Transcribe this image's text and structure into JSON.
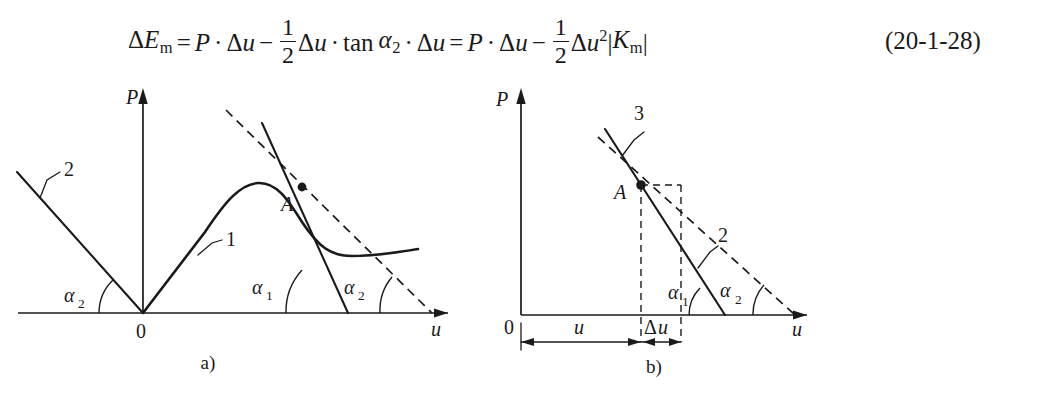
{
  "equation": {
    "number": "(20-1-28)",
    "lhs": {
      "delta": "Δ",
      "E": "E",
      "E_sub": "m"
    },
    "terms": {
      "equals": "=",
      "P": "P",
      "cdot": "·",
      "minus": "−",
      "delta": "Δ",
      "u": "u",
      "frac_num": "1",
      "frac_den": "2",
      "tan": "tan",
      "alpha": "α",
      "alpha_sub_2": "2",
      "square": "2",
      "K": "K",
      "K_sub": "m",
      "abs_bar": "|"
    },
    "plain_text": "ΔEₘ = P · Δu − (1/2)Δu · tan α₂ · Δu = P · Δu − (1/2)Δu²|Kₘ|"
  },
  "figure_a": {
    "caption": "a)",
    "y_axis_label": "P",
    "x_axis_label": "u",
    "origin_label": "0",
    "point_label": "A",
    "curve_label": "1",
    "line_label": "2",
    "angle_left_label": "α",
    "angle_left_sub": "2",
    "angle_right_1_label": "α",
    "angle_right_1_sub": "1",
    "angle_right_2_label": "α",
    "angle_right_2_sub": "2"
  },
  "figure_b": {
    "caption": "b)",
    "y_axis_label": "P",
    "x_axis_label": "u",
    "origin_label": "0",
    "point_label": "A",
    "line_solid_label": "3",
    "line_dashed_label": "2",
    "dim_u_label": "u",
    "dim_du_delta": "Δ",
    "dim_du_u": "u",
    "angle_1_label": "α",
    "angle_1_sub": "1",
    "angle_2_label": "α",
    "angle_2_sub": "2"
  },
  "colors": {
    "ink": "#1a1a1a",
    "background": "#ffffff"
  }
}
